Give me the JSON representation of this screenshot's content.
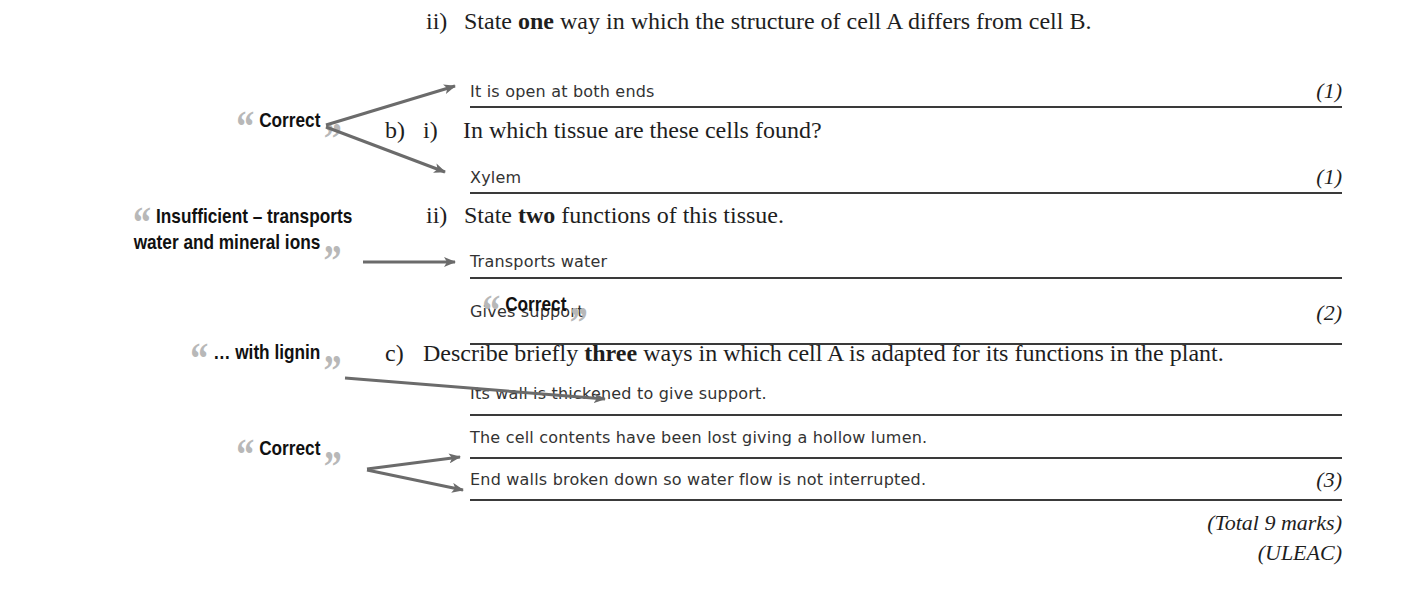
{
  "questions": {
    "a_ii": {
      "number": "ii)",
      "text_pre": "State ",
      "text_bold": "one",
      "text_post": " way in which the structure of cell A differs from cell B.",
      "answer": "It is open at both ends",
      "marks": "(1)"
    },
    "b_i": {
      "part": "b)",
      "number": "i)",
      "text": "In which tissue are these cells found?",
      "answer": "Xylem",
      "marks": "(1)"
    },
    "b_ii": {
      "number": "ii)",
      "text_pre": "State ",
      "text_bold": "two",
      "text_post": " functions of this tissue.",
      "answers": [
        "Transports water",
        "Gives support"
      ],
      "marks": "(2)"
    },
    "c": {
      "part": "c)",
      "text_pre": "Describe briefly ",
      "text_bold": "three",
      "text_post": " ways in which cell A is adapted for its functions in the plant.",
      "answers": [
        "Its wall is thickened to give support.",
        "The cell contents have been lost giving a hollow lumen.",
        "End walls broken down so water flow is not interrupted."
      ],
      "marks": "(3)"
    }
  },
  "footer": {
    "total": "(Total 9 marks)",
    "board": "(ULEAC)"
  },
  "comments": {
    "c1": "Correct",
    "c2_line1": "Insufficient – transports",
    "c2_line2": "water and mineral ions",
    "c3": "Correct",
    "c4": "… with lignin",
    "c5": "Correct"
  },
  "quote_marks": {
    "open": "“",
    "close": "”"
  },
  "colors": {
    "arrow": "#6b6b6b",
    "quote": "#b8b8b8",
    "text": "#1e1e1e"
  }
}
